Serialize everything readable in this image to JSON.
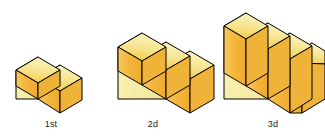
{
  "scene": {
    "title": "Growing staircase sequence",
    "background_color": "#ffffff",
    "outline_color": "#000000",
    "palette": {
      "side_face": "#F7EFA8",
      "side_face_shade": "#EFE298",
      "tread_light": "#FAF0B0",
      "tread_gold": "#F0C83C",
      "riser": "#F5B942",
      "riser_dark": "#E8A830",
      "end_face": "#F3C455"
    },
    "projection": "isometric",
    "baseline_y": 113,
    "figures": [
      {
        "id": "figure-1",
        "label": "1st",
        "steps": 2,
        "origin_x": 16,
        "size": "small"
      },
      {
        "id": "figure-2",
        "label": "2d",
        "steps": 3,
        "origin_x": 118,
        "size": "medium"
      },
      {
        "id": "figure-3",
        "label": "3d",
        "steps": 4,
        "origin_x": 238,
        "size": "large"
      }
    ]
  }
}
